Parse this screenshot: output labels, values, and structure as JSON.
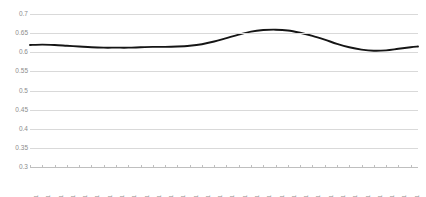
{
  "chart_data": {
    "type": "line",
    "title": "",
    "subtitle": "",
    "xlabel": "",
    "ylabel": "",
    "grid": true,
    "legend": false,
    "legend_position": "none",
    "line_color": "#151515",
    "gridline_color": "#d9d9d9",
    "tick_label_color": "#8c8c8c",
    "ylim": [
      0.3,
      0.7
    ],
    "ytick_values": [
      0.3,
      0.35,
      0.4,
      0.45,
      0.5,
      0.55,
      0.6,
      0.65,
      0.7
    ],
    "ytick_labels": [
      "0.3",
      "0.35",
      "0.4",
      "0.45",
      "0.5",
      "0.55",
      "0.6",
      "0.65",
      "0.7"
    ],
    "xlim": [
      1,
      317
    ],
    "xtick_labels": [
      "1",
      "11",
      "21",
      "31",
      "41",
      "51",
      "61",
      "71",
      "81",
      "91",
      "101",
      "111",
      "121",
      "131",
      "141",
      "151",
      "161",
      "171",
      "181",
      "191",
      "201",
      "211",
      "221",
      "231",
      "241",
      "251",
      "261",
      "271",
      "281",
      "291",
      "301",
      "311"
    ],
    "xtick_values": [
      1,
      11,
      21,
      31,
      41,
      51,
      61,
      71,
      81,
      91,
      101,
      111,
      121,
      131,
      141,
      151,
      161,
      171,
      181,
      191,
      201,
      211,
      221,
      231,
      241,
      251,
      261,
      271,
      281,
      291,
      301,
      311
    ],
    "series": [
      {
        "name": "series-1",
        "x": [
          1,
          11,
          21,
          31,
          41,
          51,
          61,
          71,
          81,
          91,
          101,
          111,
          121,
          131,
          141,
          151,
          161,
          171,
          181,
          191,
          201,
          211,
          221,
          231,
          241,
          251,
          261,
          271,
          281,
          291,
          301,
          311,
          317
        ],
        "values": [
          0.619,
          0.62,
          0.619,
          0.617,
          0.615,
          0.613,
          0.612,
          0.612,
          0.612,
          0.613,
          0.614,
          0.614,
          0.615,
          0.617,
          0.621,
          0.628,
          0.637,
          0.646,
          0.654,
          0.658,
          0.659,
          0.657,
          0.651,
          0.643,
          0.633,
          0.622,
          0.613,
          0.607,
          0.604,
          0.605,
          0.609,
          0.613,
          0.615
        ]
      }
    ]
  }
}
